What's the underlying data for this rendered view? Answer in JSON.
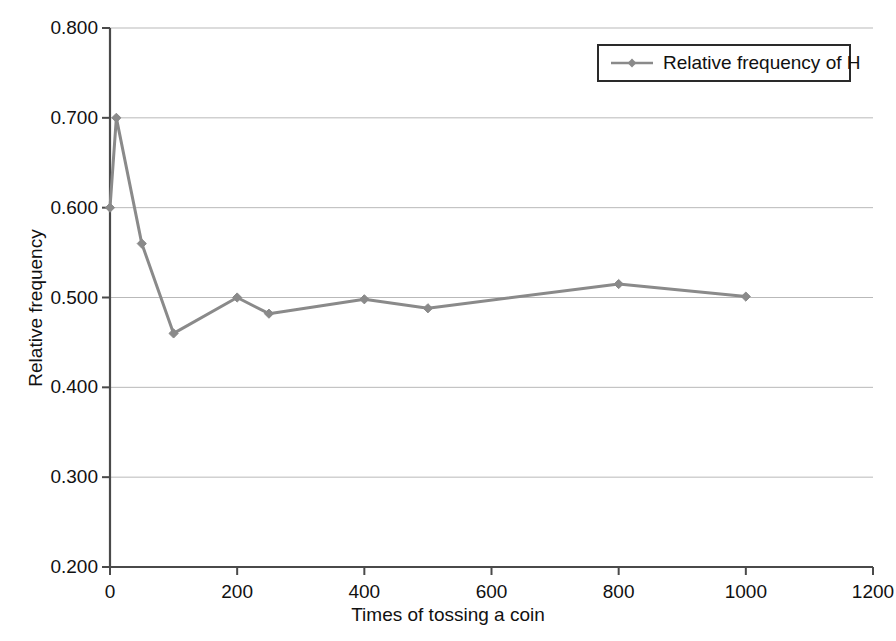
{
  "chart_data": {
    "type": "line",
    "title": "",
    "xlabel": "Times of tossing a coin",
    "ylabel": "Relative frequency",
    "xlim": [
      0,
      1200
    ],
    "ylim": [
      0.2,
      0.8
    ],
    "xticks": [
      "0",
      "200",
      "400",
      "600",
      "800",
      "1000",
      "1200"
    ],
    "xtick_values": [
      0,
      200,
      400,
      600,
      800,
      1000,
      1200
    ],
    "yticks": [
      "0.200",
      "0.300",
      "0.400",
      "0.500",
      "0.600",
      "0.700",
      "0.800"
    ],
    "ytick_values": [
      0.2,
      0.3,
      0.4,
      0.5,
      0.6,
      0.7,
      0.8
    ],
    "grid": "horizontal",
    "legend_position": "top-right",
    "series": [
      {
        "name": "Relative frequency of H",
        "color": "#8a8a8a",
        "marker": "diamond",
        "x": [
          0,
          10,
          50,
          100,
          200,
          250,
          400,
          500,
          800,
          1000
        ],
        "y": [
          0.6,
          0.7,
          0.56,
          0.46,
          0.5,
          0.482,
          0.498,
          0.488,
          0.515,
          0.501
        ]
      }
    ]
  },
  "legend": {
    "entries": [
      {
        "label": "Relative frequency of H"
      }
    ]
  },
  "axes": {
    "x_title": "Times of tossing a coin",
    "y_title": "Relative frequency"
  },
  "colors": {
    "series": "#8a8a8a",
    "gridline": "#b9b9b9",
    "axis": "#4a4a4a",
    "text": "#111111",
    "background": "#ffffff"
  }
}
